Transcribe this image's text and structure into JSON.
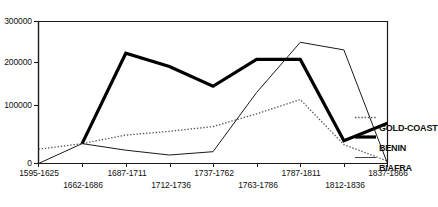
{
  "chart_data": {
    "type": "line",
    "title": "",
    "subtitle": "",
    "xlabel": "",
    "ylabel": "",
    "ylim": [
      0,
      300000
    ],
    "yticks": [
      0,
      100000,
      200000,
      300000
    ],
    "ytick_labels": [
      "0",
      "100000",
      "200000",
      "300000"
    ],
    "grid": false,
    "legend_position": "right",
    "categories": [
      "1595-1625",
      "1662-1686",
      "1687-1711",
      "1712-1736",
      "1737-1762",
      "1763-1786",
      "1787-1811",
      "1812-1836",
      "1837-1866"
    ],
    "series": [
      {
        "name": "GOLD-COAST",
        "style": "dotted",
        "color": "#555555",
        "values": [
          30000,
          42000,
          60000,
          68000,
          78000,
          105000,
          135000,
          40000,
          5000
        ]
      },
      {
        "name": "BENIN",
        "style": "thick-solid",
        "color": "#000000",
        "values": [
          null,
          42000,
          233000,
          205000,
          163000,
          220000,
          220000,
          48000,
          85000
        ]
      },
      {
        "name": "BIAFRA",
        "style": "thin-solid",
        "color": "#000000",
        "values": [
          0,
          42000,
          28000,
          18000,
          25000,
          150000,
          256000,
          240000,
          0
        ]
      }
    ]
  },
  "axis": {
    "y_tick_labels": [
      "300000",
      "200000",
      "100000",
      "0"
    ],
    "x_tick_labels_top": [
      "1595-1625",
      "1687-1711",
      "1737-1762",
      "1787-1811",
      "1837-1866"
    ],
    "x_tick_labels_bottom": [
      "1662-1686",
      "1712-1736",
      "1763-1786",
      "1812-1836"
    ]
  },
  "legend": {
    "items": [
      {
        "label": "GOLD-COAST",
        "swatch": "dotted-line-swatch"
      },
      {
        "label": "BENIN",
        "swatch": "thick-line-swatch"
      },
      {
        "label": "BIAFRA",
        "swatch": "thin-line-swatch"
      }
    ]
  }
}
